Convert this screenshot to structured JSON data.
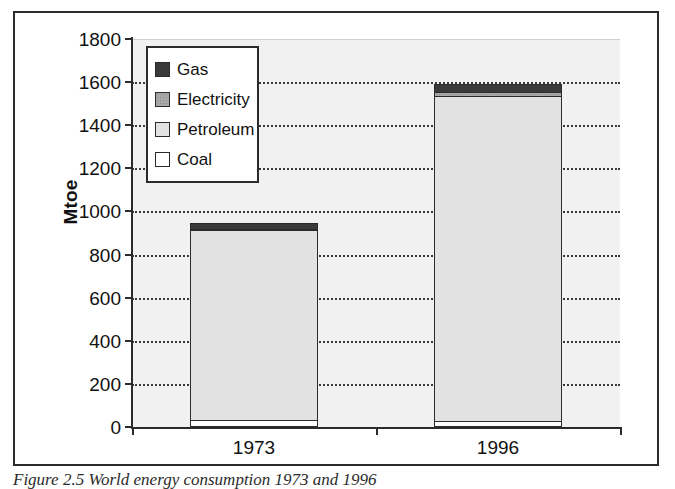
{
  "figure": {
    "caption": "Figure 2.5 World energy consumption 1973 and 1996"
  },
  "chart_data": {
    "type": "bar",
    "title": "",
    "subtitle": "",
    "stacked": true,
    "xlabel": "",
    "ylabel": "Mtoe",
    "categories": [
      "1973",
      "1996"
    ],
    "ylim": [
      0,
      1800
    ],
    "yticks": [
      0,
      200,
      400,
      600,
      800,
      1000,
      1200,
      1400,
      1600,
      1800
    ],
    "ytick_labels": [
      "0",
      "200",
      "400",
      "600",
      "800",
      "1000",
      "1200",
      "1400",
      "1600",
      "1800"
    ],
    "grid": "horizontal-dotted",
    "legend_position": "upper-left-inside",
    "series": [
      {
        "name": "Coal",
        "color": "#ffffff",
        "values": [
          25,
          18
        ]
      },
      {
        "name": "Petroleum",
        "color": "#e2e2e2",
        "values": [
          890,
          1518
        ]
      },
      {
        "name": "Electricity",
        "color": "#a8a8a8",
        "values": [
          5,
          16
        ]
      },
      {
        "name": "Gas",
        "color": "#3a3a3a",
        "values": [
          28,
          38
        ]
      }
    ],
    "totals": [
      948,
      1590
    ],
    "legend_order": [
      "Gas",
      "Electricity",
      "Petroleum",
      "Coal"
    ]
  },
  "legend": {
    "items": [
      {
        "label": "Gas"
      },
      {
        "label": "Electricity"
      },
      {
        "label": "Petroleum"
      },
      {
        "label": "Coal"
      }
    ]
  },
  "axis": {
    "y_title": "Mtoe"
  }
}
